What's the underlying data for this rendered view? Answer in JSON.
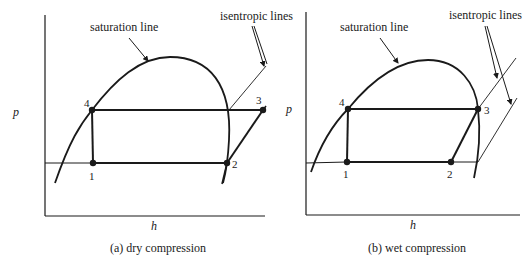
{
  "figure": {
    "panels": [
      {
        "id": "a",
        "caption": "(a) dry compression",
        "y_axis_label": "p",
        "x_axis_label": "h",
        "saturation_label": "saturation line",
        "isentropic_label": "isentropic lines",
        "points": [
          {
            "label": "1",
            "x": 93,
            "y": 163
          },
          {
            "label": "2",
            "x": 227,
            "y": 163
          },
          {
            "label": "3",
            "x": 263,
            "y": 110
          },
          {
            "label": "4",
            "x": 92,
            "y": 110
          }
        ]
      },
      {
        "id": "b",
        "caption": "(b) wet compression",
        "y_axis_label": "p",
        "x_axis_label": "h",
        "saturation_label": "saturation line",
        "isentropic_label": "isentropic lines",
        "points": [
          {
            "label": "1",
            "x": 347,
            "y": 162
          },
          {
            "label": "2",
            "x": 451,
            "y": 162
          },
          {
            "label": "3",
            "x": 478,
            "y": 109
          },
          {
            "label": "4",
            "x": 348,
            "y": 109
          }
        ]
      }
    ],
    "colors": {
      "ink": "#1a1a1a",
      "background": "#ffffff"
    }
  }
}
